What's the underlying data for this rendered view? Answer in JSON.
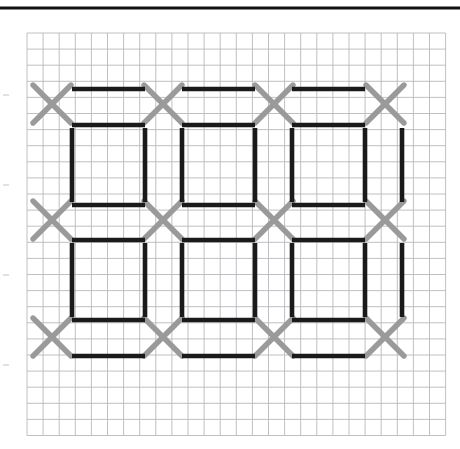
{
  "figure": {
    "canvas": {
      "width": 460,
      "height": 449,
      "background": "#ffffff"
    },
    "top_rule": {
      "y": 8,
      "x1": 0,
      "x2": 460,
      "thickness": 3,
      "color": "#111111"
    },
    "grid": {
      "label": "graph-paper-grid",
      "x0": 27,
      "y0": 33,
      "cell": 16.1,
      "cols": 26,
      "rows": 25,
      "line_color": "#b9b9bd",
      "line_width": 0.9,
      "minor_color": "#d8d8dc"
    },
    "colors": {
      "cross": "#9a9a9a",
      "segment": "#1a1a1a",
      "grid": "#b9b9bd",
      "rule": "#111111",
      "background": "#ffffff"
    },
    "stroke_widths": {
      "cross": 5.4,
      "segment": 4.6
    },
    "crosses": {
      "name": "gray-x-marks",
      "count": 16,
      "half_size": 19,
      "columns_x": [
        52,
        163,
        274,
        385
      ],
      "rows_y": [
        104,
        220,
        337
      ],
      "points": [
        [
          52,
          104
        ],
        [
          163,
          104
        ],
        [
          274,
          104
        ],
        [
          385,
          104
        ],
        [
          52,
          220
        ],
        [
          163,
          220
        ],
        [
          274,
          220
        ],
        [
          385,
          220
        ],
        [
          52,
          337
        ],
        [
          163,
          337
        ],
        [
          274,
          337
        ],
        [
          385,
          337
        ]
      ]
    },
    "segments": {
      "name": "black-matchstick-segments",
      "horizontal": [
        {
          "x1": 72,
          "x2": 145,
          "y": 89
        },
        {
          "x1": 182,
          "x2": 255,
          "y": 89
        },
        {
          "x1": 292,
          "x2": 365,
          "y": 89
        },
        {
          "x1": 72,
          "x2": 145,
          "y": 125
        },
        {
          "x1": 182,
          "x2": 255,
          "y": 125
        },
        {
          "x1": 292,
          "x2": 365,
          "y": 125
        },
        {
          "x1": 72,
          "x2": 145,
          "y": 205
        },
        {
          "x1": 182,
          "x2": 255,
          "y": 205
        },
        {
          "x1": 292,
          "x2": 365,
          "y": 205
        },
        {
          "x1": 72,
          "x2": 145,
          "y": 240
        },
        {
          "x1": 182,
          "x2": 255,
          "y": 240
        },
        {
          "x1": 292,
          "x2": 365,
          "y": 240
        },
        {
          "x1": 72,
          "x2": 145,
          "y": 320
        },
        {
          "x1": 182,
          "x2": 255,
          "y": 320
        },
        {
          "x1": 292,
          "x2": 365,
          "y": 320
        },
        {
          "x1": 72,
          "x2": 145,
          "y": 356
        },
        {
          "x1": 182,
          "x2": 255,
          "y": 356
        },
        {
          "x1": 292,
          "x2": 365,
          "y": 356
        }
      ],
      "vertical": [
        {
          "y1": 128,
          "y2": 202,
          "x": 72
        },
        {
          "y1": 128,
          "y2": 202,
          "x": 145
        },
        {
          "y1": 128,
          "y2": 202,
          "x": 182
        },
        {
          "y1": 128,
          "y2": 202,
          "x": 255
        },
        {
          "y1": 128,
          "y2": 202,
          "x": 292
        },
        {
          "y1": 128,
          "y2": 202,
          "x": 365
        },
        {
          "y1": 128,
          "y2": 202,
          "x": 402
        },
        {
          "y1": 243,
          "y2": 317,
          "x": 72
        },
        {
          "y1": 243,
          "y2": 317,
          "x": 145
        },
        {
          "y1": 243,
          "y2": 317,
          "x": 182
        },
        {
          "y1": 243,
          "y2": 317,
          "x": 255
        },
        {
          "y1": 243,
          "y2": 317,
          "x": 292
        },
        {
          "y1": 243,
          "y2": 317,
          "x": 365
        },
        {
          "y1": 243,
          "y2": 317,
          "x": 402
        }
      ]
    },
    "margin_ticks": {
      "name": "left-margin-ticks",
      "x": 3,
      "points_y": [
        95,
        185,
        275,
        365
      ],
      "length": 6,
      "color": "#c4c4c4"
    }
  }
}
